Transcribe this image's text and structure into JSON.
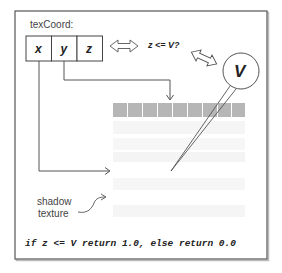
{
  "diagram": {
    "texcoord_label": "texCoord:",
    "components": [
      "x",
      "y",
      "z"
    ],
    "comparison": "z <= V?",
    "depth_value": "V",
    "shadow_label_line1": "shadow",
    "shadow_label_line2": "texture",
    "code": "if z <= V return 1.0, else return 0.0",
    "texture_rows": 5,
    "texture_cols": 9,
    "colors": {
      "frame": "#555555",
      "sampled_row": "#b5b5b5",
      "faint_rows": "#f6f6f6",
      "line": "#444444"
    }
  }
}
